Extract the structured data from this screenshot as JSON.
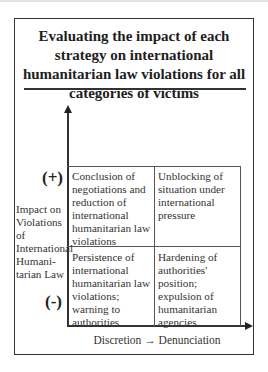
{
  "title": "Evaluating the impact of each strategy on international humanitarian law violations for all categories of victims",
  "axes": {
    "y_label": "Impact on Violations of International Humani-tarian Law",
    "y_label_lines": [
      "Impact on",
      "Violations",
      "of",
      "International",
      "Humani-",
      "tarian Law"
    ],
    "y_high": "(+)",
    "y_low": "(-)",
    "x_label": "Discretion → Denunciation"
  },
  "quadrants": {
    "top_left": "Conclusion of negotiations and reduction of international humanitarian law violations",
    "top_right": "Unblocking of situation under international pressure",
    "bottom_left": "Persistence of international humanitarian law violations; warning to authorities",
    "bottom_right": "Hardening of authorities' position; expulsion of humanitarian agencies"
  },
  "colors": {
    "line": "#333333",
    "text": "#222222",
    "background": "#ffffff"
  }
}
